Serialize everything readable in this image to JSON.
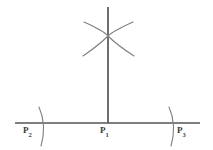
{
  "figure": {
    "background_color": "#ffffff",
    "stroke_color": "#555555",
    "label_color": "#3a3a3a",
    "width": 213,
    "height": 150
  },
  "labels": {
    "p1": {
      "base": "P",
      "subscript": "1",
      "text": "P1"
    },
    "p2": {
      "base": "P",
      "subscript": "2",
      "text": "P2"
    },
    "p3": {
      "base": "P",
      "subscript": "3",
      "text": "P3"
    }
  },
  "geometry": {
    "baseline": {
      "name": "horizontal-line",
      "x1": 15,
      "y1": 123,
      "x2": 200,
      "y2": 123
    },
    "perpendicular": {
      "name": "vertical-line",
      "x1": 108,
      "y1": 7,
      "x2": 108,
      "y2": 123
    },
    "intersection_point": {
      "x": 108,
      "y": 36
    },
    "arcs_top": [
      {
        "name": "arc-upper-left-to-lower-right",
        "start_x": 84,
        "start_y": 22,
        "end_x": 134,
        "end_y": 56
      },
      {
        "name": "arc-upper-right-to-lower-left",
        "start_x": 133,
        "start_y": 22,
        "end_x": 83,
        "end_y": 56
      }
    ],
    "arcs_base": [
      {
        "name": "arc-mark-near-p2",
        "cx": 42,
        "top_y": 107,
        "bottom_y": 146
      },
      {
        "name": "arc-mark-near-p3",
        "cx": 172,
        "top_y": 107,
        "bottom_y": 146
      }
    ]
  }
}
